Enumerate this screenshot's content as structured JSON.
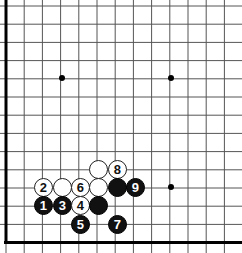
{
  "figure": {
    "kind": "go-board-diagram",
    "width": 242,
    "height": 253,
    "background_color": "#ffffff"
  },
  "board": {
    "line_color": "#555555",
    "border_color": "#000000",
    "cell_size": 18.2,
    "origin_x": 6,
    "origin_y": 6,
    "columns": 13,
    "rows": 13,
    "border_left_width": 3,
    "border_bottom_width": 3,
    "star_point_color": "#000000",
    "star_point_radius": 3,
    "star_points": [
      {
        "name": "star-point-left",
        "x": 62,
        "y": 78
      },
      {
        "name": "star-point-center",
        "x": 171,
        "y": 78
      },
      {
        "name": "star-point-lower",
        "x": 171,
        "y": 187
      }
    ]
  },
  "stones": [
    {
      "name": "white-stone-plain-a",
      "color": "white",
      "label": "",
      "x": 98,
      "y": 169,
      "r": 9.5
    },
    {
      "name": "white-stone-8",
      "color": "white",
      "label": "8",
      "x": 117,
      "y": 169,
      "r": 9.5
    },
    {
      "name": "white-stone-2",
      "color": "white",
      "label": "2",
      "x": 43,
      "y": 187,
      "r": 9.5
    },
    {
      "name": "white-stone-plain-b",
      "color": "white",
      "label": "",
      "x": 62,
      "y": 187,
      "r": 9.5
    },
    {
      "name": "white-stone-6",
      "color": "white",
      "label": "6",
      "x": 80,
      "y": 187,
      "r": 9.5
    },
    {
      "name": "white-stone-plain-c",
      "color": "white",
      "label": "",
      "x": 98,
      "y": 187,
      "r": 9.5
    },
    {
      "name": "black-stone-plain-a",
      "color": "black",
      "label": "",
      "x": 117,
      "y": 187,
      "r": 9.5
    },
    {
      "name": "black-stone-9",
      "color": "black",
      "label": "9",
      "x": 135,
      "y": 187,
      "r": 9.5
    },
    {
      "name": "black-stone-1",
      "color": "black",
      "label": "1",
      "x": 43,
      "y": 205,
      "r": 9.5
    },
    {
      "name": "black-stone-3",
      "color": "black",
      "label": "3",
      "x": 62,
      "y": 205,
      "r": 9.5
    },
    {
      "name": "white-stone-4",
      "color": "white",
      "label": "4",
      "x": 80,
      "y": 205,
      "r": 9.5
    },
    {
      "name": "black-stone-plain-b",
      "color": "black",
      "label": "",
      "x": 98,
      "y": 205,
      "r": 9.5
    },
    {
      "name": "black-stone-5",
      "color": "black",
      "label": "5",
      "x": 80,
      "y": 224,
      "r": 9.5
    },
    {
      "name": "black-stone-7",
      "color": "black",
      "label": "7",
      "x": 117,
      "y": 224,
      "r": 9.5
    }
  ]
}
